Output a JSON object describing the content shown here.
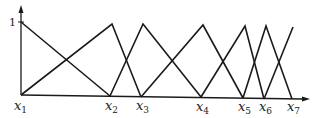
{
  "diagram": {
    "title": "",
    "y_axis_label": "1",
    "x_labels": [
      {
        "base": "x",
        "sub": "1",
        "x": 21
      },
      {
        "base": "x",
        "sub": "2",
        "x": 112
      },
      {
        "base": "x",
        "sub": "3",
        "x": 143
      },
      {
        "base": "x",
        "sub": "4",
        "x": 203
      },
      {
        "base": "x",
        "sub": "5",
        "x": 245
      },
      {
        "base": "x",
        "sub": "6",
        "x": 266
      },
      {
        "base": "x",
        "sub": "7",
        "x": 293
      }
    ],
    "colors": {
      "line": "#1a1a1a",
      "background": "#ffffff"
    }
  }
}
